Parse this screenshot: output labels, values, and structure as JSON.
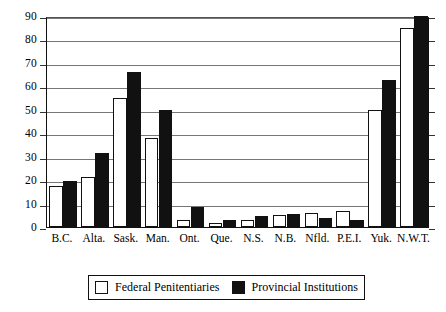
{
  "chart_data": {
    "type": "bar",
    "title": "",
    "subtitle": "",
    "xlabel": "",
    "ylabel": "",
    "ylim": [
      0,
      90
    ],
    "yticks": [
      0,
      10,
      20,
      30,
      40,
      50,
      60,
      70,
      80,
      90
    ],
    "ytick_labels": [
      "0",
      "10",
      "20",
      "30",
      "40",
      "50",
      "60",
      "70",
      "80",
      "90"
    ],
    "grid": true,
    "legend_position": "bottom",
    "categories": [
      "B.C.",
      "Alta.",
      "Sask.",
      "Man.",
      "Ont.",
      "Que.",
      "N.S.",
      "N.B.",
      "Nfld.",
      "P.E.I.",
      "Yuk.",
      "N.W.T."
    ],
    "series": [
      {
        "name": "Federal Penitentiaries",
        "color": "#ffffff",
        "edge_color": "#111111",
        "values": [
          17.5,
          21.5,
          55,
          38,
          3,
          1.5,
          3,
          5,
          6,
          7,
          50,
          85
        ]
      },
      {
        "name": "Provincial Institutions",
        "color": "#111111",
        "edge_color": "#111111",
        "values": [
          19.5,
          31.5,
          66,
          50,
          8.5,
          3,
          4.5,
          5.5,
          4,
          3,
          62.5,
          90
        ]
      }
    ]
  },
  "legend": {
    "entries": [
      {
        "label": "Federal Penitentiaries",
        "swatch": "white-square"
      },
      {
        "label": "Provincial Institutions",
        "swatch": "black-square"
      }
    ]
  }
}
